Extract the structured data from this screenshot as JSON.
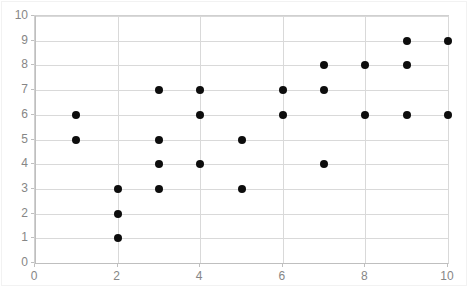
{
  "chart_data": {
    "type": "scatter",
    "title": "",
    "xlabel": "",
    "ylabel": "",
    "xlim": [
      0,
      10
    ],
    "ylim": [
      0,
      10
    ],
    "grid": true,
    "legend": false,
    "x_tick_labels": [
      "0",
      "2",
      "4",
      "6",
      "8",
      "10"
    ],
    "x_tick_values": [
      0,
      2,
      4,
      6,
      8,
      10
    ],
    "y_tick_labels": [
      "0",
      "1",
      "2",
      "3",
      "4",
      "5",
      "6",
      "7",
      "8",
      "9",
      "10"
    ],
    "y_tick_values": [
      0,
      1,
      2,
      3,
      4,
      5,
      6,
      7,
      8,
      9,
      10
    ],
    "series": [
      {
        "name": "Series 1",
        "marker": "circle",
        "color": "#0d0d0d",
        "points": [
          [
            1,
            6
          ],
          [
            1,
            5
          ],
          [
            2,
            3
          ],
          [
            2,
            2
          ],
          [
            2,
            1
          ],
          [
            3,
            7
          ],
          [
            3,
            5
          ],
          [
            3,
            4
          ],
          [
            3,
            3
          ],
          [
            4,
            7
          ],
          [
            4,
            6
          ],
          [
            4,
            4
          ],
          [
            5,
            5
          ],
          [
            5,
            3
          ],
          [
            6,
            7
          ],
          [
            6,
            6
          ],
          [
            7,
            8
          ],
          [
            7,
            7
          ],
          [
            7,
            4
          ],
          [
            8,
            8
          ],
          [
            8,
            6
          ],
          [
            9,
            9
          ],
          [
            9,
            8
          ],
          [
            9,
            6
          ],
          [
            10,
            9
          ],
          [
            10,
            6
          ]
        ]
      }
    ]
  },
  "style": {
    "gridline_color": "#d9d9d9",
    "axis_color": "#bfbfbf",
    "tick_label_color": "#868686",
    "plot_background": "#ffffff",
    "marker_color": "#0d0d0d"
  }
}
